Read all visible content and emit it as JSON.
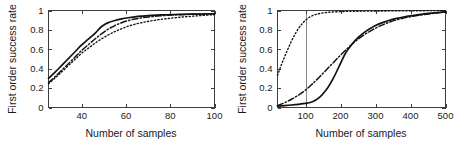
{
  "figure": {
    "background": "#ffffff",
    "line_color": "#111111",
    "axis_color": "#3d3d3d",
    "refline_color": "#8a8a8a",
    "panels": [
      "left",
      "right"
    ]
  },
  "chart_data": [
    {
      "id": "left",
      "type": "line",
      "title": "",
      "xlabel": "Number of samples",
      "ylabel": "First order success rate",
      "xlim": [
        25,
        100
      ],
      "ylim": [
        0,
        1
      ],
      "xticks": [
        40,
        60,
        80,
        100
      ],
      "xticklabels": [
        "40",
        "60",
        "80",
        "100"
      ],
      "yticks": [
        0,
        0.2,
        0.4,
        0.6,
        0.8,
        1
      ],
      "yticklabels": [
        "0",
        "0.2",
        "0.4",
        "0.6",
        "0.8",
        "1"
      ],
      "grid": false,
      "legend": "none",
      "reference_lines": [],
      "series": [
        {
          "name": "solid",
          "style": "solid",
          "x": [
            25,
            28,
            31,
            34,
            37,
            40,
            43,
            46,
            49,
            52,
            55,
            58,
            61,
            64,
            67,
            70,
            74,
            78,
            82,
            86,
            90,
            95,
            100
          ],
          "values": [
            0.3,
            0.365,
            0.435,
            0.505,
            0.575,
            0.645,
            0.705,
            0.765,
            0.835,
            0.875,
            0.897,
            0.913,
            0.925,
            0.934,
            0.941,
            0.947,
            0.952,
            0.956,
            0.959,
            0.961,
            0.963,
            0.964,
            0.965
          ]
        },
        {
          "name": "dash-dot",
          "style": "dashdot",
          "x": [
            25,
            28,
            31,
            34,
            37,
            40,
            43,
            46,
            49,
            52,
            55,
            58,
            61,
            64,
            67,
            70,
            74,
            78,
            82,
            86,
            90,
            95,
            100
          ],
          "values": [
            0.255,
            0.318,
            0.385,
            0.452,
            0.52,
            0.588,
            0.648,
            0.706,
            0.76,
            0.808,
            0.845,
            0.874,
            0.896,
            0.912,
            0.924,
            0.933,
            0.942,
            0.949,
            0.954,
            0.958,
            0.961,
            0.964,
            0.966
          ]
        },
        {
          "name": "dotted",
          "style": "dotted",
          "x": [
            25,
            28,
            31,
            34,
            37,
            40,
            43,
            46,
            49,
            52,
            55,
            58,
            61,
            64,
            67,
            70,
            74,
            78,
            82,
            86,
            90,
            95,
            100
          ],
          "values": [
            0.245,
            0.305,
            0.368,
            0.432,
            0.496,
            0.56,
            0.612,
            0.662,
            0.708,
            0.748,
            0.782,
            0.812,
            0.838,
            0.858,
            0.874,
            0.888,
            0.903,
            0.915,
            0.925,
            0.934,
            0.941,
            0.95,
            0.957
          ]
        }
      ]
    },
    {
      "id": "right",
      "type": "line",
      "title": "",
      "xlabel": "Number of samples",
      "ylabel": "First order success rate",
      "xlim": [
        20,
        500
      ],
      "ylim": [
        0,
        1
      ],
      "xticks": [
        100,
        200,
        300,
        400,
        500
      ],
      "xticklabels": [
        "100",
        "200",
        "300",
        "400",
        "500"
      ],
      "yticks": [
        0,
        0.2,
        0.4,
        0.6,
        0.8,
        1
      ],
      "yticklabels": [
        "0",
        "0.2",
        "0.4",
        "0.6",
        "0.8",
        "1"
      ],
      "grid": false,
      "legend": "none",
      "reference_lines": [
        {
          "axis": "x",
          "value": 100
        }
      ],
      "series": [
        {
          "name": "solid",
          "style": "solid",
          "x": [
            20,
            40,
            60,
            80,
            100,
            120,
            140,
            160,
            180,
            200,
            215,
            230,
            250,
            270,
            290,
            300,
            320,
            340,
            360,
            380,
            400,
            430,
            460,
            500
          ],
          "values": [
            0.015,
            0.02,
            0.026,
            0.033,
            0.042,
            0.06,
            0.105,
            0.185,
            0.305,
            0.455,
            0.565,
            0.64,
            0.72,
            0.78,
            0.825,
            0.845,
            0.875,
            0.9,
            0.918,
            0.933,
            0.945,
            0.96,
            0.972,
            0.985
          ]
        },
        {
          "name": "dash-dot",
          "style": "dashdot",
          "x": [
            20,
            40,
            60,
            80,
            100,
            120,
            140,
            160,
            180,
            200,
            220,
            240,
            260,
            280,
            300,
            320,
            340,
            360,
            380,
            400,
            430,
            460,
            500
          ],
          "values": [
            0.02,
            0.048,
            0.085,
            0.128,
            0.18,
            0.245,
            0.315,
            0.39,
            0.465,
            0.54,
            0.61,
            0.675,
            0.73,
            0.778,
            0.818,
            0.852,
            0.88,
            0.903,
            0.921,
            0.936,
            0.953,
            0.968,
            0.985
          ]
        },
        {
          "name": "dotted",
          "style": "dotted",
          "x": [
            20,
            30,
            40,
            50,
            60,
            70,
            80,
            90,
            100,
            115,
            130,
            150,
            170,
            200,
            240,
            280,
            320,
            360,
            400,
            450,
            500
          ],
          "values": [
            0.33,
            0.43,
            0.52,
            0.605,
            0.685,
            0.755,
            0.815,
            0.862,
            0.9,
            0.938,
            0.96,
            0.975,
            0.983,
            0.989,
            0.992,
            0.994,
            0.995,
            0.996,
            0.997,
            0.998,
            0.999
          ]
        }
      ]
    }
  ]
}
